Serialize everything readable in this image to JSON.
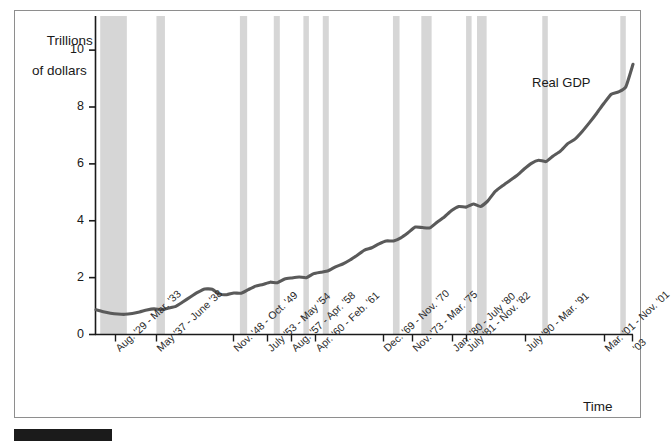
{
  "figure": {
    "y_axis_title_line1": "Trillions",
    "y_axis_title_line2": "of dollars",
    "x_axis_title": "Time",
    "series_label": "Real GDP",
    "line_color": "#5a5a5a",
    "recession_band_color": "#d6d6d6",
    "frame_color": "#8e8e8e",
    "axis_color": "#1a1a1a"
  },
  "chart_data": {
    "type": "line",
    "title": "",
    "subtitle": "",
    "xlabel": "Time",
    "ylabel": "Trillions of dollars",
    "ylim": [
      0,
      11.2
    ],
    "yticks": [
      "0",
      "2",
      "4",
      "6",
      "8",
      "10"
    ],
    "ytick_values": [
      0,
      2,
      4,
      6,
      8,
      10
    ],
    "xlim": [
      1929,
      2003
    ],
    "grid": false,
    "legend": "inline-annotation",
    "series": [
      {
        "name": "Real GDP",
        "units": "trillions of dollars",
        "x": [
          1929,
          1930,
          1931,
          1932,
          1933,
          1934,
          1935,
          1936,
          1937,
          1938,
          1939,
          1940,
          1941,
          1942,
          1943,
          1944,
          1945,
          1946,
          1947,
          1948,
          1949,
          1950,
          1951,
          1952,
          1953,
          1954,
          1955,
          1956,
          1957,
          1958,
          1959,
          1960,
          1961,
          1962,
          1963,
          1964,
          1965,
          1966,
          1967,
          1968,
          1969,
          1970,
          1971,
          1972,
          1973,
          1974,
          1975,
          1976,
          1977,
          1978,
          1979,
          1980,
          1981,
          1982,
          1983,
          1984,
          1985,
          1986,
          1987,
          1988,
          1989,
          1990,
          1991,
          1992,
          1993,
          1994,
          1995,
          1996,
          1997,
          1998,
          1999,
          2000,
          2001,
          2002,
          2003
        ],
        "values": [
          0.87,
          0.8,
          0.75,
          0.72,
          0.71,
          0.74,
          0.79,
          0.86,
          0.9,
          0.87,
          0.93,
          0.99,
          1.15,
          1.32,
          1.48,
          1.6,
          1.59,
          1.42,
          1.4,
          1.46,
          1.45,
          1.58,
          1.7,
          1.76,
          1.84,
          1.82,
          1.95,
          1.99,
          2.02,
          2.0,
          2.14,
          2.19,
          2.24,
          2.38,
          2.48,
          2.62,
          2.79,
          2.97,
          3.05,
          3.19,
          3.29,
          3.29,
          3.4,
          3.58,
          3.78,
          3.76,
          3.75,
          3.95,
          4.13,
          4.36,
          4.5,
          4.48,
          4.59,
          4.5,
          4.7,
          5.03,
          5.23,
          5.41,
          5.59,
          5.82,
          6.02,
          6.13,
          6.08,
          6.28,
          6.45,
          6.71,
          6.87,
          7.14,
          7.45,
          7.78,
          8.13,
          8.45,
          8.53,
          8.7,
          9.5
        ],
        "start_value": 0.87,
        "end_value": 9.5,
        "trough_1933": 0.71,
        "peak_1944": 1.6
      }
    ],
    "recessions": [
      {
        "label": "Aug. '29 - Mar. '33",
        "start": 1929.58,
        "end": 1933.25,
        "tick_x_px": 115
      },
      {
        "label": "May '37 - June '38",
        "start": 1937.33,
        "end": 1938.5,
        "tick_x_px": 156
      },
      {
        "label": "Nov. '48 - Oct. '49",
        "start": 1948.83,
        "end": 1949.83,
        "tick_x_px": 233
      },
      {
        "label": "July '53 - May '54",
        "start": 1953.5,
        "end": 1954.33,
        "tick_x_px": 267
      },
      {
        "label": "Aug. '57 - Apr. '58",
        "start": 1957.58,
        "end": 1958.25,
        "tick_x_px": 291
      },
      {
        "label": "Apr. '60 - Feb. '61",
        "start": 1960.25,
        "end": 1961.08,
        "tick_x_px": 315
      },
      {
        "label": "Dec. '69 - Nov. '70",
        "start": 1969.92,
        "end": 1970.83,
        "tick_x_px": 383
      },
      {
        "label": "Nov. '73 - Mar. '75",
        "start": 1973.83,
        "end": 1975.25,
        "tick_x_px": 412
      },
      {
        "label": "Jan. '80 - July '80",
        "start": 1980.0,
        "end": 1980.5,
        "tick_x_px": 452
      },
      {
        "label": "July '81 - Nov. '82",
        "start": 1981.5,
        "end": 1982.83,
        "tick_x_px": 466
      },
      {
        "label": "July '90 - Mar. '91",
        "start": 1990.5,
        "end": 1991.25,
        "tick_x_px": 525
      },
      {
        "label": "Mar. '01 - Nov. '01",
        "start": 2001.25,
        "end": 2001.83,
        "tick_x_px": 604
      },
      {
        "label": "'03",
        "start": null,
        "end": null,
        "tick_x_px": 632
      }
    ]
  }
}
